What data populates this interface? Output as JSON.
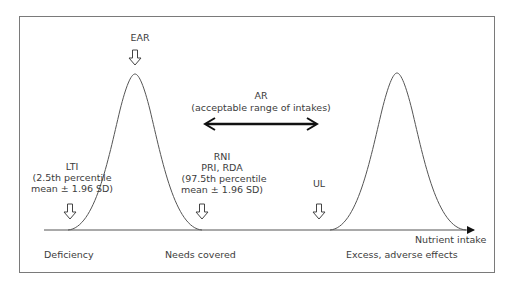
{
  "labels": {
    "ear": "EAR",
    "ar_title": "AR",
    "ar_subtitle": "(acceptable range of intakes)",
    "lti_line1": "LTI",
    "lti_line2": "(2.5th percentile",
    "lti_line3": "mean ± 1.96 SD)",
    "rni_line1": "RNI",
    "rni_line2": "PRI, RDA",
    "rni_line3": "(97.5th percentile",
    "rni_line4": "mean ± 1.96 SD)",
    "ul": "UL",
    "x_axis": "Nutrient intake",
    "zone_deficiency": "Deficiency",
    "zone_needs": "Needs covered",
    "zone_excess": "Excess, adverse effects"
  },
  "colors": {
    "line": "#555555",
    "frame": "#7a7a7a",
    "arrow": "#111111",
    "text": "#3c3c3c"
  }
}
